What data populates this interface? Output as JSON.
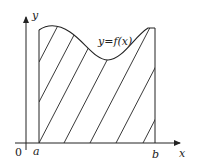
{
  "diagram": {
    "axes": {
      "x_label": "x",
      "y_label": "y",
      "origin_label": "0"
    },
    "bounds": {
      "left_label": "a",
      "right_label": "b"
    },
    "curve_label": "y=f(x)",
    "region": "shaded area between curve, x-axis, x=a and x=b (diagonal hatching)",
    "colors": {
      "stroke": "#222222",
      "background": "#ffffff"
    }
  }
}
